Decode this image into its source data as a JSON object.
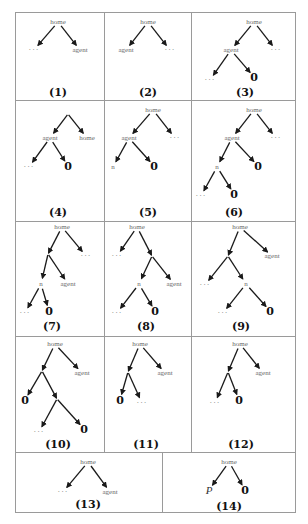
{
  "figure": {
    "panels": [
      {
        "caption": "(1)",
        "box": [
          15,
          12,
          89,
          88
        ],
        "caption_pos": [
          58,
          92
        ],
        "nodes": [
          {
            "id": "r",
            "label": "home",
            "x": 58,
            "y": 22,
            "kind": "text"
          },
          {
            "id": "a",
            "label": "...",
            "x": 34,
            "y": 50,
            "kind": "dots"
          },
          {
            "id": "b",
            "label": "agent",
            "x": 80,
            "y": 50,
            "kind": "text"
          }
        ],
        "edges": [
          [
            "r",
            "a"
          ],
          [
            "r",
            "b"
          ]
        ]
      },
      {
        "caption": "(2)",
        "box": [
          104,
          12,
          87,
          88
        ],
        "caption_pos": [
          148,
          92
        ],
        "nodes": [
          {
            "id": "r",
            "label": "home",
            "x": 148,
            "y": 22,
            "kind": "text"
          },
          {
            "id": "a",
            "label": "agent",
            "x": 126,
            "y": 50,
            "kind": "text"
          },
          {
            "id": "b",
            "label": "...",
            "x": 170,
            "y": 50,
            "kind": "dots"
          }
        ],
        "edges": [
          [
            "r",
            "a"
          ],
          [
            "r",
            "b"
          ]
        ]
      },
      {
        "caption": "(3)",
        "box": [
          191,
          12,
          104,
          88
        ],
        "caption_pos": [
          245,
          92
        ],
        "nodes": [
          {
            "id": "r",
            "label": "home",
            "x": 254,
            "y": 22,
            "kind": "text"
          },
          {
            "id": "a",
            "label": "agent",
            "x": 231,
            "y": 50,
            "kind": "text"
          },
          {
            "id": "b",
            "label": "...",
            "x": 276,
            "y": 50,
            "kind": "dots"
          },
          {
            "id": "c",
            "label": "...",
            "x": 210,
            "y": 80,
            "kind": "dots"
          },
          {
            "id": "d",
            "label": "0",
            "x": 254,
            "y": 77,
            "kind": "zero"
          }
        ],
        "edges": [
          [
            "r",
            "a"
          ],
          [
            "r",
            "b"
          ],
          [
            "a",
            "c"
          ],
          [
            "a",
            "d"
          ]
        ]
      },
      {
        "caption": "(4)",
        "box": [
          15,
          100,
          89,
          121
        ],
        "caption_pos": [
          58,
          212
        ],
        "nodes": [
          {
            "id": "r",
            "label": "",
            "x": 68,
            "y": 114,
            "kind": "text"
          },
          {
            "id": "a",
            "label": "agent",
            "x": 50,
            "y": 138,
            "kind": "text"
          },
          {
            "id": "b",
            "label": "home",
            "x": 87,
            "y": 138,
            "kind": "text"
          },
          {
            "id": "c",
            "label": "...",
            "x": 29,
            "y": 167,
            "kind": "dots"
          },
          {
            "id": "d",
            "label": "0",
            "x": 68,
            "y": 166,
            "kind": "zero"
          }
        ],
        "edges": [
          [
            "r",
            "a"
          ],
          [
            "r",
            "b"
          ],
          [
            "a",
            "c"
          ],
          [
            "a",
            "d"
          ]
        ]
      },
      {
        "caption": "(5)",
        "box": [
          104,
          100,
          87,
          121
        ],
        "caption_pos": [
          148,
          212
        ],
        "nodes": [
          {
            "id": "r",
            "label": "home",
            "x": 153,
            "y": 110,
            "kind": "text"
          },
          {
            "id": "a",
            "label": "agent",
            "x": 129,
            "y": 138,
            "kind": "text"
          },
          {
            "id": "b",
            "label": "...",
            "x": 175,
            "y": 138,
            "kind": "dots"
          },
          {
            "id": "c",
            "label": "n",
            "x": 113,
            "y": 167,
            "kind": "text"
          },
          {
            "id": "d",
            "label": "0",
            "x": 154,
            "y": 166,
            "kind": "zero"
          }
        ],
        "edges": [
          [
            "r",
            "a"
          ],
          [
            "r",
            "b"
          ],
          [
            "a",
            "c"
          ],
          [
            "a",
            "d"
          ]
        ]
      },
      {
        "caption": "(6)",
        "box": [
          191,
          100,
          104,
          121
        ],
        "caption_pos": [
          234,
          212
        ],
        "nodes": [
          {
            "id": "r",
            "label": "home",
            "x": 254,
            "y": 110,
            "kind": "text"
          },
          {
            "id": "a",
            "label": "agent",
            "x": 232,
            "y": 138,
            "kind": "text"
          },
          {
            "id": "b",
            "label": "...",
            "x": 276,
            "y": 138,
            "kind": "dots"
          },
          {
            "id": "c",
            "label": "n",
            "x": 217,
            "y": 167,
            "kind": "text"
          },
          {
            "id": "d",
            "label": "0",
            "x": 258,
            "y": 166,
            "kind": "zero"
          },
          {
            "id": "e",
            "label": "...",
            "x": 201,
            "y": 196,
            "kind": "dots"
          },
          {
            "id": "f",
            "label": "0",
            "x": 234,
            "y": 194,
            "kind": "zero"
          }
        ],
        "edges": [
          [
            "r",
            "a"
          ],
          [
            "r",
            "b"
          ],
          [
            "a",
            "c"
          ],
          [
            "a",
            "d"
          ],
          [
            "c",
            "e"
          ],
          [
            "c",
            "f"
          ]
        ]
      },
      {
        "caption": "(7)",
        "box": [
          15,
          221,
          89,
          115
        ],
        "caption_pos": [
          52,
          326
        ],
        "nodes": [
          {
            "id": "r",
            "label": "home",
            "x": 62,
            "y": 227,
            "kind": "text"
          },
          {
            "id": "a",
            "label": "",
            "x": 48,
            "y": 254,
            "kind": "text"
          },
          {
            "id": "b",
            "label": "...",
            "x": 86,
            "y": 256,
            "kind": "dots"
          },
          {
            "id": "c",
            "label": "n",
            "x": 41,
            "y": 284,
            "kind": "text"
          },
          {
            "id": "d",
            "label": "agent",
            "x": 68,
            "y": 284,
            "kind": "text"
          },
          {
            "id": "e",
            "label": "...",
            "x": 25,
            "y": 313,
            "kind": "dots"
          },
          {
            "id": "f",
            "label": "0",
            "x": 49,
            "y": 311,
            "kind": "zero"
          }
        ],
        "edges": [
          [
            "r",
            "a"
          ],
          [
            "r",
            "b"
          ],
          [
            "a",
            "c"
          ],
          [
            "a",
            "d"
          ],
          [
            "c",
            "e"
          ],
          [
            "c",
            "f"
          ]
        ]
      },
      {
        "caption": "(8)",
        "box": [
          104,
          221,
          87,
          115
        ],
        "caption_pos": [
          146,
          326
        ],
        "nodes": [
          {
            "id": "r",
            "label": "home",
            "x": 137,
            "y": 227,
            "kind": "text"
          },
          {
            "id": "a",
            "label": "...",
            "x": 117,
            "y": 256,
            "kind": "dots"
          },
          {
            "id": "b",
            "label": "",
            "x": 152,
            "y": 256,
            "kind": "text"
          },
          {
            "id": "c",
            "label": "n",
            "x": 139,
            "y": 284,
            "kind": "text"
          },
          {
            "id": "d",
            "label": "agent",
            "x": 174,
            "y": 284,
            "kind": "text"
          },
          {
            "id": "e",
            "label": "...",
            "x": 117,
            "y": 313,
            "kind": "dots"
          },
          {
            "id": "f",
            "label": "0",
            "x": 155,
            "y": 311,
            "kind": "zero"
          }
        ],
        "edges": [
          [
            "r",
            "a"
          ],
          [
            "r",
            "b"
          ],
          [
            "b",
            "c"
          ],
          [
            "b",
            "d"
          ],
          [
            "c",
            "e"
          ],
          [
            "c",
            "f"
          ]
        ]
      },
      {
        "caption": "(9)",
        "box": [
          191,
          221,
          104,
          115
        ],
        "caption_pos": [
          241,
          326
        ],
        "nodes": [
          {
            "id": "r",
            "label": "home",
            "x": 240,
            "y": 227,
            "kind": "text"
          },
          {
            "id": "a",
            "label": "",
            "x": 228,
            "y": 256,
            "kind": "text"
          },
          {
            "id": "b",
            "label": "agent",
            "x": 272,
            "y": 256,
            "kind": "text"
          },
          {
            "id": "c",
            "label": "...",
            "x": 205,
            "y": 285,
            "kind": "dots"
          },
          {
            "id": "d",
            "label": "n",
            "x": 246,
            "y": 284,
            "kind": "text"
          },
          {
            "id": "e",
            "label": "...",
            "x": 223,
            "y": 313,
            "kind": "dots"
          },
          {
            "id": "f",
            "label": "0",
            "x": 270,
            "y": 311,
            "kind": "zero"
          }
        ],
        "edges": [
          [
            "r",
            "a"
          ],
          [
            "r",
            "b"
          ],
          [
            "a",
            "c"
          ],
          [
            "a",
            "d"
          ],
          [
            "d",
            "e"
          ],
          [
            "d",
            "f"
          ]
        ]
      },
      {
        "caption": "(10)",
        "box": [
          15,
          336,
          89,
          116
        ],
        "caption_pos": [
          58,
          444
        ],
        "nodes": [
          {
            "id": "r",
            "label": "home",
            "x": 55,
            "y": 344,
            "kind": "text"
          },
          {
            "id": "a",
            "label": "",
            "x": 42,
            "y": 371,
            "kind": "text"
          },
          {
            "id": "b",
            "label": "agent",
            "x": 82,
            "y": 373,
            "kind": "text"
          },
          {
            "id": "c",
            "label": "0",
            "x": 25,
            "y": 400,
            "kind": "zero"
          },
          {
            "id": "d",
            "label": "",
            "x": 57,
            "y": 399,
            "kind": "text"
          },
          {
            "id": "e",
            "label": "...",
            "x": 39,
            "y": 432,
            "kind": "dots"
          },
          {
            "id": "f",
            "label": "0",
            "x": 84,
            "y": 429,
            "kind": "zero"
          }
        ],
        "edges": [
          [
            "r",
            "a"
          ],
          [
            "r",
            "b"
          ],
          [
            "a",
            "c"
          ],
          [
            "a",
            "d"
          ],
          [
            "d",
            "e"
          ],
          [
            "d",
            "f"
          ]
        ]
      },
      {
        "caption": "(11)",
        "box": [
          104,
          336,
          87,
          116
        ],
        "caption_pos": [
          146,
          444
        ],
        "nodes": [
          {
            "id": "r",
            "label": "home",
            "x": 140,
            "y": 344,
            "kind": "text"
          },
          {
            "id": "a",
            "label": "",
            "x": 128,
            "y": 372,
            "kind": "text"
          },
          {
            "id": "b",
            "label": "agent",
            "x": 165,
            "y": 373,
            "kind": "text"
          },
          {
            "id": "c",
            "label": "0",
            "x": 120,
            "y": 400,
            "kind": "zero"
          },
          {
            "id": "d",
            "label": "...",
            "x": 142,
            "y": 403,
            "kind": "dots"
          }
        ],
        "edges": [
          [
            "r",
            "a"
          ],
          [
            "r",
            "b"
          ],
          [
            "a",
            "c"
          ],
          [
            "a",
            "d"
          ]
        ]
      },
      {
        "caption": "(12)",
        "box": [
          191,
          336,
          104,
          116
        ],
        "caption_pos": [
          241,
          444
        ],
        "nodes": [
          {
            "id": "r",
            "label": "home",
            "x": 240,
            "y": 344,
            "kind": "text"
          },
          {
            "id": "a",
            "label": "",
            "x": 228,
            "y": 372,
            "kind": "text"
          },
          {
            "id": "b",
            "label": "agent",
            "x": 263,
            "y": 373,
            "kind": "text"
          },
          {
            "id": "c",
            "label": "...",
            "x": 215,
            "y": 403,
            "kind": "dots"
          },
          {
            "id": "d",
            "label": "0",
            "x": 239,
            "y": 400,
            "kind": "zero"
          }
        ],
        "edges": [
          [
            "r",
            "a"
          ],
          [
            "r",
            "b"
          ],
          [
            "a",
            "c"
          ],
          [
            "a",
            "d"
          ]
        ]
      },
      {
        "caption": "(13)",
        "box": [
          15,
          452,
          147,
          60
        ],
        "caption_pos": [
          88,
          504
        ],
        "nodes": [
          {
            "id": "r",
            "label": "home",
            "x": 88,
            "y": 462,
            "kind": "text"
          },
          {
            "id": "a",
            "label": "...",
            "x": 63,
            "y": 492,
            "kind": "dots"
          },
          {
            "id": "b",
            "label": "agent",
            "x": 110,
            "y": 492,
            "kind": "text"
          }
        ],
        "edges": [
          [
            "r",
            "a"
          ],
          [
            "r",
            "b"
          ]
        ]
      },
      {
        "caption": "(14)",
        "box": [
          162,
          452,
          133,
          60
        ],
        "caption_pos": [
          229,
          506
        ],
        "nodes": [
          {
            "id": "r",
            "label": "home",
            "x": 229,
            "y": 462,
            "kind": "text"
          },
          {
            "id": "a",
            "label": "P",
            "x": 209,
            "y": 490,
            "kind": "P"
          },
          {
            "id": "b",
            "label": "0",
            "x": 245,
            "y": 490,
            "kind": "zero"
          }
        ],
        "edges": [
          [
            "r",
            "a"
          ],
          [
            "r",
            "b"
          ]
        ]
      }
    ]
  },
  "style": {
    "edge_color": "#1a1a1a",
    "border_color": "#9a9a9a"
  }
}
